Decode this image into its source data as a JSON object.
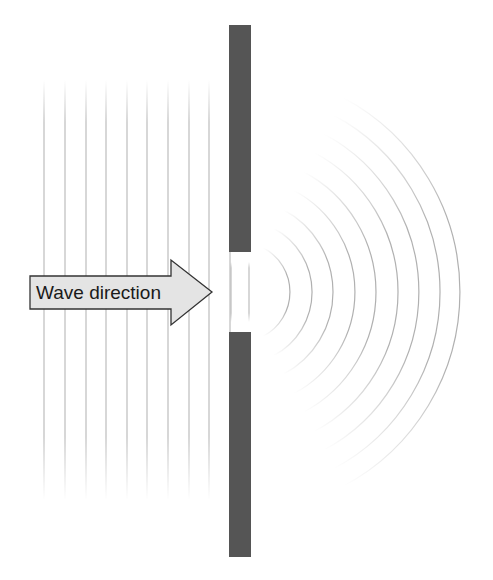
{
  "diagram": {
    "arrow": {
      "label": "Wave direction",
      "fill": "#e4e4e4",
      "stroke": "#333333"
    },
    "barrier": {
      "color": "#555555",
      "x": 229,
      "width": 22,
      "top_segment": {
        "y1": 25,
        "y2": 252
      },
      "bottom_segment": {
        "y1": 332,
        "y2": 557
      }
    },
    "incident_wavefronts": {
      "type": "plane",
      "count": 10,
      "x_positions": [
        44,
        65,
        86,
        106,
        127,
        147,
        168,
        189,
        209,
        230
      ],
      "y_range": [
        80,
        500
      ],
      "color": "#b8b8b8"
    },
    "slit_wavefronts": {
      "x_positions": [
        231,
        249
      ],
      "y_range": [
        262,
        322
      ]
    },
    "diffracted_wavefronts": {
      "type": "circular",
      "count": 9,
      "center": [
        240,
        292
      ],
      "radii": [
        50,
        72,
        93,
        115,
        136,
        158,
        179,
        200,
        220
      ],
      "color": "#b0b0b0"
    }
  }
}
